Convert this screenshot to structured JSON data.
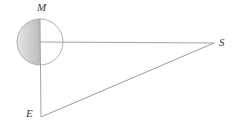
{
  "figure": {
    "background_color": "#ffffff",
    "line_color": "#9a9a9a",
    "label_color": "#3a3a3a",
    "labels": {
      "moon": "M",
      "sun": "S",
      "earth": "E"
    },
    "circle": {
      "name": "moon-circle",
      "center_x": 40,
      "center_y": 42,
      "radius": 23,
      "stroke_color": "#a8a8a8",
      "shaded_half": "left",
      "shade_light": "#efefef",
      "shade_dark": "#bcbcbc"
    },
    "points": {
      "M": {
        "x": 40,
        "y": 42
      },
      "S": {
        "x": 214,
        "y": 43
      },
      "E": {
        "x": 41,
        "y": 117
      }
    },
    "segments": [
      {
        "name": "segment-M-S",
        "from": "M",
        "to": "S",
        "orientation": "horizontal"
      },
      {
        "name": "segment-M-E",
        "from": "M",
        "to": "E",
        "orientation": "vertical"
      },
      {
        "name": "segment-E-S",
        "from": "E",
        "to": "S",
        "orientation": "hypotenuse"
      }
    ],
    "vertical_line": {
      "name": "moon-vertical-diameter",
      "x": 40,
      "y_top": 19,
      "y_bottom": 117
    }
  }
}
